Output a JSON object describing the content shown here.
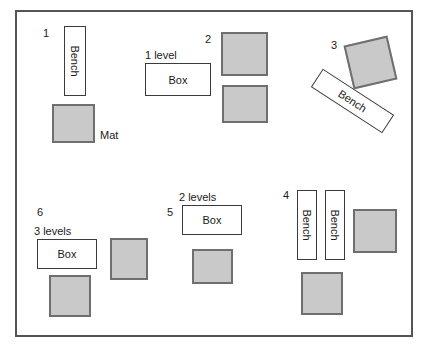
{
  "diagram": {
    "colors": {
      "mat_fill": "#c9c9c9",
      "mat_stroke": "#6f6f6f",
      "outline_stroke": "#3b3b3b",
      "border_stroke": "#555555",
      "text": "#1a1a1a",
      "background": "#ffffff"
    }
  },
  "stations": [
    {
      "number": "1",
      "items": [
        {
          "name": "bench",
          "label": "Bench",
          "orientation": "vertical"
        },
        {
          "name": "mat",
          "label": "Mat",
          "orientation": "square"
        }
      ]
    },
    {
      "number": "2",
      "items": [
        {
          "name": "mat",
          "label": "",
          "orientation": "square"
        },
        {
          "name": "mat",
          "label": "",
          "orientation": "square"
        }
      ]
    },
    {
      "number": "3",
      "items": [
        {
          "name": "mat",
          "label": "",
          "orientation": "rotated-square"
        },
        {
          "name": "bench",
          "label": "Bench",
          "orientation": "diagonal"
        }
      ]
    },
    {
      "number": "4",
      "items": [
        {
          "name": "bench",
          "label": "Bench",
          "orientation": "vertical"
        },
        {
          "name": "bench",
          "label": "Bench",
          "orientation": "vertical"
        },
        {
          "name": "mat",
          "label": "",
          "orientation": "square"
        },
        {
          "name": "mat",
          "label": "",
          "orientation": "square"
        }
      ]
    },
    {
      "number": "5",
      "items": [
        {
          "name": "box",
          "label": "Box",
          "levels": "2 levels"
        },
        {
          "name": "mat",
          "label": "",
          "orientation": "square"
        }
      ]
    },
    {
      "number": "6",
      "items": [
        {
          "name": "box",
          "label": "Box",
          "levels": "3 levels"
        },
        {
          "name": "mat",
          "label": "",
          "orientation": "square"
        },
        {
          "name": "mat",
          "label": "",
          "orientation": "square"
        }
      ]
    }
  ],
  "labels": {
    "station1_num": "1",
    "station2_num": "2",
    "station3_num": "3",
    "station4_num": "4",
    "station5_num": "5",
    "station6_num": "6",
    "bench1": "Bench",
    "mat1": "Mat",
    "box_top_levels": "1 level",
    "box_top": "Box",
    "bench3": "Bench",
    "bench4a": "Bench",
    "bench4b": "Bench",
    "box5_levels": "2 levels",
    "box5": "Box",
    "box6_levels": "3 levels",
    "box6": "Box"
  }
}
